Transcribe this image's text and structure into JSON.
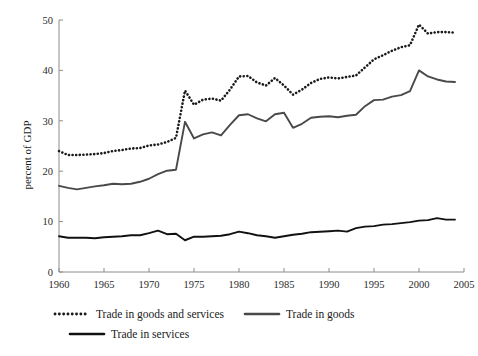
{
  "chart_data": {
    "type": "line",
    "title": "",
    "subtitle": "",
    "xlabel": "",
    "ylabel": "percent of GDP",
    "xlim": [
      1960,
      2005
    ],
    "ylim": [
      0,
      50
    ],
    "xticks": [
      1960,
      1965,
      1970,
      1975,
      1980,
      1985,
      1990,
      1995,
      2000,
      2005
    ],
    "yticks": [
      0,
      10,
      20,
      30,
      40,
      50
    ],
    "grid": false,
    "legend_position": "bottom",
    "x": [
      1960,
      1961,
      1962,
      1963,
      1964,
      1965,
      1966,
      1967,
      1968,
      1969,
      1970,
      1971,
      1972,
      1973,
      1974,
      1975,
      1976,
      1977,
      1978,
      1979,
      1980,
      1981,
      1982,
      1983,
      1984,
      1985,
      1986,
      1987,
      1988,
      1989,
      1990,
      1991,
      1992,
      1993,
      1994,
      1995,
      1996,
      1997,
      1998,
      1999,
      2000,
      2001,
      2002,
      2003,
      2004
    ],
    "series": [
      {
        "name": "Trade in goods and services",
        "style": "dotted",
        "color": "#1a1a1a",
        "values": [
          24.0,
          23.2,
          23.2,
          23.3,
          23.4,
          23.6,
          24.0,
          24.2,
          24.5,
          24.6,
          25.1,
          25.3,
          25.8,
          26.6,
          36.0,
          33.2,
          34.2,
          34.4,
          34.0,
          36.2,
          38.8,
          38.9,
          37.6,
          37.0,
          38.5,
          37.0,
          35.2,
          36.2,
          37.5,
          38.3,
          38.6,
          38.4,
          38.7,
          39.0,
          40.6,
          42.2,
          43.0,
          43.9,
          44.6,
          45.0,
          49.1,
          47.3,
          47.6,
          47.6,
          47.5
        ]
      },
      {
        "name": "Trade in goods",
        "style": "solid",
        "color": "#494949",
        "values": [
          17.1,
          16.7,
          16.4,
          16.7,
          17.0,
          17.2,
          17.5,
          17.4,
          17.5,
          17.9,
          18.5,
          19.4,
          20.1,
          20.3,
          29.8,
          26.5,
          27.3,
          27.7,
          27.1,
          29.2,
          31.1,
          31.3,
          30.5,
          29.9,
          31.3,
          31.6,
          28.6,
          29.4,
          30.6,
          30.8,
          30.9,
          30.7,
          31.0,
          31.2,
          32.9,
          34.1,
          34.2,
          34.8,
          35.1,
          35.9,
          40.0,
          38.8,
          38.2,
          37.8,
          37.7
        ]
      },
      {
        "name": "Trade in services",
        "style": "solid",
        "color": "#111111",
        "values": [
          7.1,
          6.8,
          6.8,
          6.8,
          6.7,
          6.9,
          7.0,
          7.1,
          7.3,
          7.3,
          7.7,
          8.2,
          7.5,
          7.6,
          6.3,
          7.0,
          7.0,
          7.1,
          7.2,
          7.5,
          8.0,
          7.7,
          7.3,
          7.1,
          6.8,
          7.1,
          7.4,
          7.6,
          7.9,
          8.0,
          8.1,
          8.2,
          8.0,
          8.7,
          9.0,
          9.1,
          9.4,
          9.5,
          9.7,
          9.9,
          10.2,
          10.3,
          10.7,
          10.4,
          10.4
        ]
      }
    ]
  },
  "axes": {
    "ylabel": "percent of GDP",
    "ytick_labels": [
      "0",
      "10",
      "20",
      "30",
      "40",
      "50"
    ],
    "xtick_labels": [
      "1960",
      "1965",
      "1970",
      "1975",
      "1980",
      "1985",
      "1990",
      "1995",
      "2000",
      "2005"
    ]
  },
  "legend": {
    "items": [
      {
        "label": "Trade in goods and services",
        "style": "dotted",
        "color": "#1a1a1a"
      },
      {
        "label": "Trade in goods",
        "style": "solid",
        "color": "#494949"
      },
      {
        "label": "Trade in services",
        "style": "solid",
        "color": "#111111"
      }
    ]
  }
}
